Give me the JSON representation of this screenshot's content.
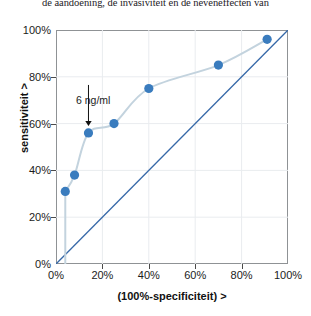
{
  "body_text": "de aandoening, de invasiviteit en de neveneffecten van",
  "chart_data": {
    "type": "line",
    "title": "",
    "xlabel": "(100%-specificiteit) >",
    "ylabel": "sensitiviteit >",
    "xlim": [
      0,
      100
    ],
    "ylim": [
      0,
      100
    ],
    "xticks": [
      "0%",
      "20%",
      "40%",
      "60%",
      "80%",
      "100%"
    ],
    "xtick_values": [
      0,
      20,
      40,
      60,
      80,
      100
    ],
    "yticks": [
      "0%",
      "20%",
      "40%",
      "60%",
      "80%",
      "100%"
    ],
    "ytick_values": [
      0,
      20,
      40,
      60,
      80,
      100
    ],
    "grid": true,
    "legend": "none",
    "series": [
      {
        "name": "ROC-curve",
        "type": "scatter+line",
        "color": "#3a7cbe",
        "line_color": "#c3d3de",
        "x": [
          4,
          8,
          14,
          25,
          40,
          70,
          91
        ],
        "y": [
          31,
          38,
          56,
          60,
          75,
          85,
          96
        ]
      },
      {
        "name": "referentielijn",
        "type": "line",
        "color": "#3668a8",
        "x": [
          0,
          100
        ],
        "y": [
          0,
          100
        ]
      }
    ],
    "annotations": [
      {
        "text": "6 ng/ml",
        "x": 14,
        "y": 56,
        "arrow": "down"
      }
    ]
  }
}
